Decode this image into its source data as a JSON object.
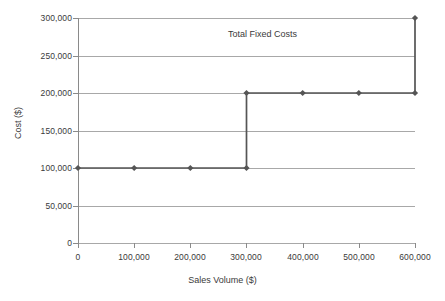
{
  "chart_data": {
    "type": "line",
    "title": "",
    "annotations": [
      {
        "text": "Total Fixed Costs",
        "x": 350000,
        "y": 282000
      }
    ],
    "xlabel": "Sales Volume ($)",
    "ylabel": "Cost ($)",
    "xlim": [
      0,
      600000
    ],
    "ylim": [
      0,
      300000
    ],
    "grid": "horizontal",
    "legend": "none",
    "xticks": [
      0,
      100000,
      200000,
      300000,
      400000,
      500000,
      600000
    ],
    "xticklabels": [
      "0",
      "100,000",
      "200,000",
      "300,000",
      "400,000",
      "500,000",
      "600,000"
    ],
    "yticks": [
      0,
      50000,
      100000,
      150000,
      200000,
      250000,
      300000
    ],
    "yticklabels": [
      "0",
      "50,000",
      "100,000",
      "150,000",
      "200,000",
      "250,000",
      "300,000"
    ],
    "series": [
      {
        "name": "Total Fixed Costs",
        "marker": "diamond",
        "color": "#555555",
        "points": [
          {
            "x": 0,
            "y": 100000
          },
          {
            "x": 100000,
            "y": 100000
          },
          {
            "x": 200000,
            "y": 100000
          },
          {
            "x": 300000,
            "y": 100000
          },
          {
            "x": 300000,
            "y": 200000
          },
          {
            "x": 400000,
            "y": 200000
          },
          {
            "x": 500000,
            "y": 200000
          },
          {
            "x": 600000,
            "y": 200000
          },
          {
            "x": 600000,
            "y": 300000
          }
        ],
        "markers_at": [
          {
            "x": 0,
            "y": 100000
          },
          {
            "x": 100000,
            "y": 100000
          },
          {
            "x": 200000,
            "y": 100000
          },
          {
            "x": 300000,
            "y": 100000
          },
          {
            "x": 300000,
            "y": 200000
          },
          {
            "x": 400000,
            "y": 200000
          },
          {
            "x": 500000,
            "y": 200000
          },
          {
            "x": 600000,
            "y": 200000
          },
          {
            "x": 600000,
            "y": 300000
          }
        ]
      }
    ]
  },
  "colors": {
    "background": "#ffffff",
    "gridline": "#a8a8a8",
    "axis": "#8a8a8a",
    "series": "#555555",
    "text": "#3a3a3a"
  }
}
